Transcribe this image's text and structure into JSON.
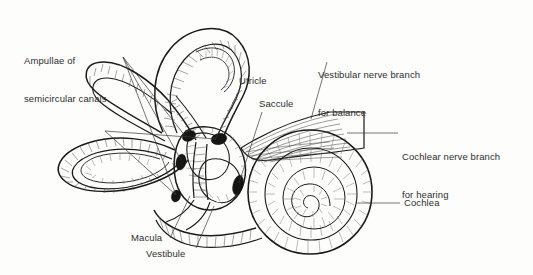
{
  "figure": {
    "background_color": "#fdfdfb",
    "ink_color": "#1a1a1a",
    "text_color": "#2e2e2e"
  },
  "labels": {
    "ampullae": {
      "line1": "Ampullae of",
      "line2": "semicircular canals"
    },
    "utricle": "Utricle",
    "saccule": "Saccule",
    "vestibular_nerve": {
      "line1": "Vestibular nerve branch",
      "line2": "for balance"
    },
    "cochlear_nerve": {
      "line1": "Cochlear nerve branch",
      "line2": "for hearing"
    },
    "cochlea": "Cochlea",
    "macula": "Macula",
    "vestibule": "Vestibule"
  }
}
